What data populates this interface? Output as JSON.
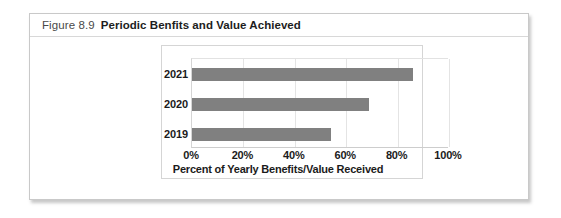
{
  "figure": {
    "number": "Figure 8.9",
    "title": "Periodic Benfits and Value Achieved"
  },
  "colors": {
    "bar": "#808080",
    "frame": "#d5d5d5",
    "gridline": "#e4e4e4",
    "text": "#1b1b1b",
    "caption_number": "#4a4a4a",
    "card_border": "#c9c9c9"
  },
  "chart_data": {
    "type": "bar",
    "orientation": "horizontal",
    "title": "",
    "categories": [
      "2019",
      "2020",
      "2021"
    ],
    "values": [
      54,
      69,
      86
    ],
    "series": [
      {
        "name": "Percent of Yearly Benefits/Value Received",
        "values": [
          54,
          69,
          86
        ]
      }
    ],
    "xlabel": "Percent of Yearly Benefits/Value Received",
    "ylabel": "",
    "xlim": [
      0,
      100
    ],
    "xticks": [
      0,
      20,
      40,
      60,
      80,
      100
    ],
    "xticklabels": [
      "0%",
      "20%",
      "40%",
      "60%",
      "80%",
      "100%"
    ],
    "grid": "vertical",
    "legend": "none"
  }
}
